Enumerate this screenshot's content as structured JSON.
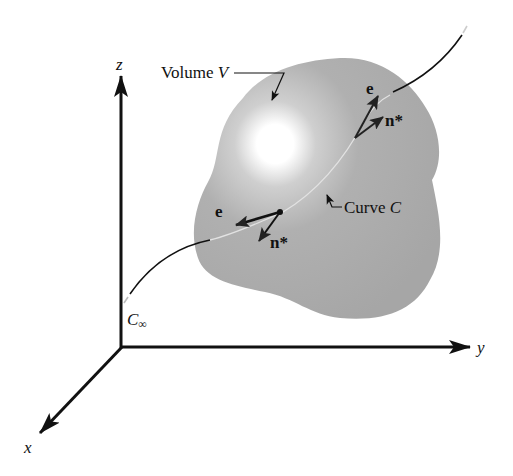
{
  "diagram": {
    "axes": {
      "x": {
        "label": "x"
      },
      "y": {
        "label": "y"
      },
      "z": {
        "label": "z"
      }
    },
    "volume": {
      "label_prefix": "Volume ",
      "label_var": "V",
      "fill_color": "#a9a9a9",
      "highlight_color": "#ffffff"
    },
    "curve": {
      "label_prefix": "Curve ",
      "label_var": "C",
      "infinity_label_base": "C",
      "infinity_label_sub": "∞"
    },
    "vectors": {
      "upper_e": "e",
      "upper_n": "n*",
      "lower_e": "e",
      "lower_n": "n*"
    }
  }
}
